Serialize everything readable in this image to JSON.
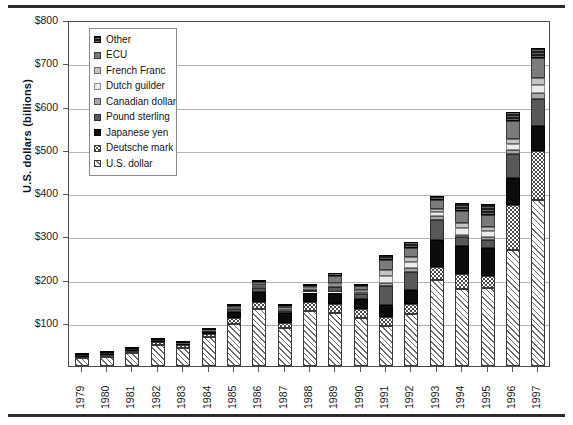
{
  "chart_data": {
    "type": "bar",
    "subtype": "stacked-vertical",
    "title": "",
    "xlabel": "",
    "ylabel": "U.S. dollars (billions)",
    "ylim": [
      0,
      800
    ],
    "ytick_values": [
      0,
      100,
      200,
      300,
      400,
      500,
      600,
      700,
      800
    ],
    "ytick_labels": [
      "",
      "$100",
      "$200",
      "$300",
      "$400",
      "$500",
      "$600",
      "$700",
      "$800"
    ],
    "grid": true,
    "grid_axis": "y",
    "legend_position": "upper-left-inside",
    "categories": [
      "1979",
      "1980",
      "1981",
      "1982",
      "1983",
      "1984",
      "1985",
      "1986",
      "1987",
      "1988",
      "1989",
      "1990",
      "1991",
      "1992",
      "1993",
      "1994",
      "1995",
      "1996",
      "1997"
    ],
    "series": [
      {
        "name": "U.S. dollar",
        "swatch": "#ffffff",
        "pattern": "diagonal-hatch",
        "values": [
          18,
          22,
          30,
          48,
          42,
          66,
          98,
          132,
          88,
          128,
          122,
          112,
          92,
          120,
          200,
          178,
          180,
          268,
          385
        ]
      },
      {
        "name": "Deutsche mark",
        "swatch": "#ffffff",
        "pattern": "dotted",
        "values": [
          4,
          4,
          5,
          7,
          6,
          8,
          12,
          16,
          12,
          20,
          22,
          20,
          22,
          24,
          30,
          34,
          28,
          104,
          112
        ]
      },
      {
        "name": "Japanese yen",
        "swatch": "#0c0c0c",
        "pattern": "solid-black",
        "values": [
          2,
          2,
          3,
          3,
          3,
          4,
          16,
          24,
          22,
          22,
          26,
          24,
          28,
          32,
          62,
          66,
          66,
          62,
          58
        ]
      },
      {
        "name": "Pound sterling",
        "swatch": "#585858",
        "pattern": "solid-dark-grey",
        "values": [
          1,
          1,
          1,
          1,
          1,
          2,
          6,
          8,
          6,
          6,
          12,
          10,
          44,
          42,
          46,
          20,
          18,
          56,
          62
        ]
      },
      {
        "name": "Canadian dollar",
        "swatch": "#a8a8a8",
        "pattern": "solid-mid-grey",
        "values": [
          1,
          1,
          1,
          1,
          1,
          1,
          2,
          4,
          3,
          2,
          4,
          4,
          6,
          8,
          10,
          6,
          6,
          10,
          14
        ]
      },
      {
        "name": "Dutch guilder",
        "swatch": "#ececec",
        "pattern": "solid-very-light-grey",
        "values": [
          0,
          0,
          0,
          0,
          0,
          1,
          1,
          2,
          2,
          2,
          3,
          3,
          16,
          14,
          8,
          16,
          14,
          14,
          18
        ]
      },
      {
        "name": "French Franc",
        "swatch": "#c4c4c4",
        "pattern": "solid-light-grey",
        "values": [
          0,
          0,
          0,
          0,
          0,
          1,
          1,
          2,
          2,
          2,
          3,
          3,
          14,
          12,
          8,
          10,
          10,
          12,
          16
        ]
      },
      {
        "name": "ECU",
        "swatch": "#7b7b7b",
        "pattern": "solid-grey",
        "values": [
          0,
          0,
          0,
          0,
          0,
          1,
          2,
          6,
          4,
          4,
          16,
          8,
          24,
          20,
          20,
          28,
          28,
          40,
          48
        ]
      },
      {
        "name": "Other",
        "swatch": "#1c1c1c",
        "pattern": "dark-horizontal-lines",
        "values": [
          2,
          2,
          2,
          2,
          2,
          3,
          4,
          6,
          4,
          4,
          6,
          6,
          10,
          14,
          10,
          18,
          24,
          22,
          22
        ]
      }
    ],
    "totals": [
      28,
      32,
      42,
      62,
      55,
      86,
      142,
      200,
      143,
      190,
      214,
      190,
      256,
      286,
      394,
      376,
      374,
      588,
      735
    ],
    "annotations": []
  },
  "legend": {
    "items": [
      {
        "label": "Other"
      },
      {
        "label": "ECU"
      },
      {
        "label": "French Franc"
      },
      {
        "label": "Dutch guilder"
      },
      {
        "label": "Canadian dollar"
      },
      {
        "label": "Pound sterling"
      },
      {
        "label": "Japanese yen"
      },
      {
        "label": "Deutsche mark"
      },
      {
        "label": "U.S. dollar"
      }
    ]
  }
}
